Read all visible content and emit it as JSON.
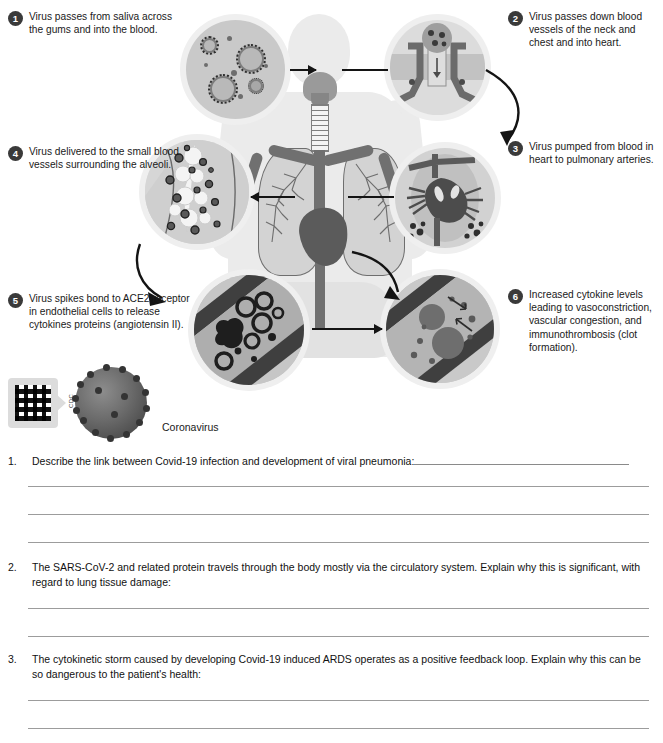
{
  "worksheet": {
    "diagram": {
      "title_cutoff": "",
      "callouts": [
        {
          "number": "1",
          "text": "Virus passes from saliva across the gums and into the blood."
        },
        {
          "number": "2",
          "text": "Virus passes down blood vessels of the neck and chest and into heart."
        },
        {
          "number": "3",
          "text": "Virus pumped from blood in heart to pulmonary arteries."
        },
        {
          "number": "4",
          "text": "Virus delivered to the small blood vessels surrounding the alveoli."
        },
        {
          "number": "5",
          "text": "Virus spikes bond to ACE2 receptor in endothelial cells to release cytokines proteins (angiotensin II)."
        },
        {
          "number": "6",
          "text": "Increased cytokine levels leading to vasoconstriction, vascular congestion, and immunothrombosis (clot formation)."
        }
      ],
      "corona_caption": "Coronavirus",
      "credit": "CDC",
      "qr_label": "qr-code"
    },
    "questions": [
      {
        "number": "1.",
        "text": "Describe the link between Covid-19 infection and development of viral pneumonia:",
        "lines": 3
      },
      {
        "number": "2.",
        "text": "The SARS-CoV-2 and related protein travels through the body mostly via the circulatory system. Explain why this is significant, with regard to lung tissue damage:",
        "lines": 2
      },
      {
        "number": "3.",
        "text": "The cytokinetic storm caused by developing Covid-19 induced ARDS operates as a positive feedback loop. Explain why this can be so dangerous to the patient's health:",
        "lines": 2
      }
    ]
  },
  "colors": {
    "ink": "#111111",
    "rule": "#9c9c9c",
    "badge": "#3a3a3a",
    "silhouette": "#ebebeb",
    "organ": "#707070"
  }
}
